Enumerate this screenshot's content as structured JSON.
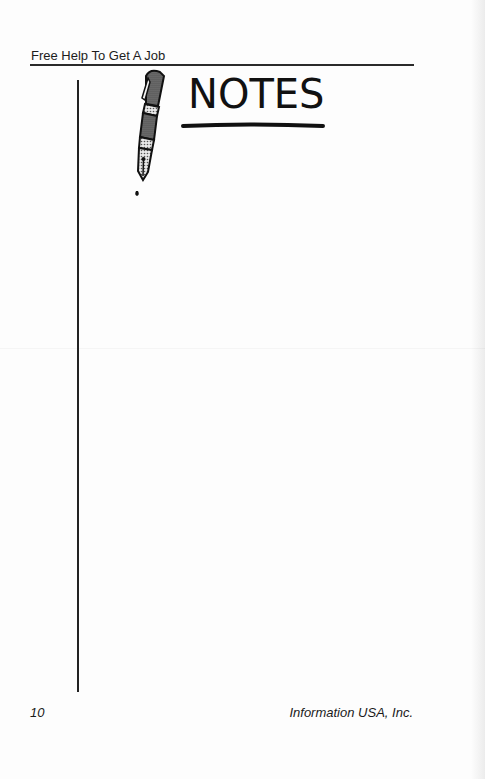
{
  "page": {
    "running_header": "Free Help To Get A Job",
    "notes_graphic": {
      "title": "NOTES",
      "icon": "fountain-pen-icon"
    },
    "footer": {
      "page_number": "10",
      "publisher": "Information USA, Inc."
    }
  },
  "colors": {
    "ink": "#1a1a1a",
    "paper": "#fdfdfd"
  }
}
